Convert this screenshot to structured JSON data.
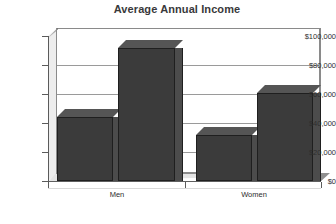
{
  "chart_data": {
    "type": "bar",
    "title": "Average Annual Income",
    "xlabel": "",
    "ylabel": "",
    "categories": [
      "Men",
      "Women"
    ],
    "series": [
      {
        "name": "Series 1",
        "values": [
          44000,
          32000
        ]
      },
      {
        "name": "Series 2",
        "values": [
          92000,
          61000
        ]
      }
    ],
    "ylim": [
      0,
      100000
    ],
    "yticks": [
      0,
      20000,
      40000,
      60000,
      80000,
      100000
    ],
    "ytick_labels": [
      "$0",
      "$20,000",
      "$40,000",
      "$60,000",
      "$80,000",
      "$100,000"
    ],
    "grid": true,
    "legend": "none",
    "style": "3d",
    "bar_color": "#3b3b3b",
    "wall_color": "#ffffff",
    "floor_color": "#e4e4e4",
    "gridline_color": "#9a9a9a",
    "title_color": "#39393b"
  },
  "axis": {
    "y_labels": [
      "$100,000",
      "$80,000",
      "$60,000",
      "$40,000",
      "$20,000",
      "$0"
    ],
    "x_labels": [
      "Men",
      "Women"
    ]
  },
  "bars": [
    {
      "label": "Men series 1",
      "value": 44000,
      "display": "$44,000"
    },
    {
      "label": "Men series 2",
      "value": 92000,
      "display": "$92,000"
    },
    {
      "label": "Women series 1",
      "value": 32000,
      "display": "$32,000"
    },
    {
      "label": "Women series 2",
      "value": 61000,
      "display": "$61,000"
    }
  ]
}
